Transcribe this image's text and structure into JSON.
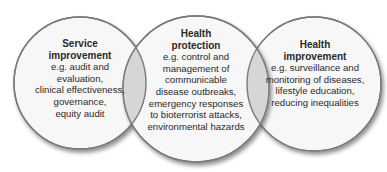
{
  "diagram": {
    "type": "venn",
    "colors": {
      "circle_fill": "#f7f7f7",
      "circle_stroke": "#7a7a7a",
      "overlap_fill": "#d6d6d6",
      "shadow": "#9a9a9a",
      "text": "#2a2a2a"
    },
    "circles": [
      {
        "id": "service-improvement",
        "title": "Service\nimprovement",
        "description": "e.g. audit and\nevaluation,\nclinical effectiveness,\ngovernance,\nequity audit"
      },
      {
        "id": "health-protection",
        "title": "Health\nprotection",
        "description": "e.g. control and\nmanagement of\ncommunicable\ndisease outbreaks,\nemergency responses\nto bioterrorist attacks,\nenvironmental hazards"
      },
      {
        "id": "health-improvement",
        "title": "Health\nimprovement",
        "description": "e.g. surveillance and\nmonitoring of diseases,\nlifestyle education,\nreducing inequalities"
      }
    ]
  }
}
